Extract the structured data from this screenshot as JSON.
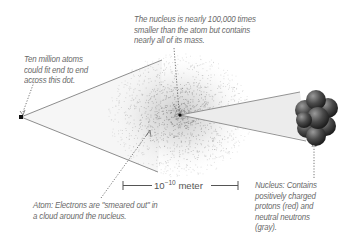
{
  "diagram": {
    "type": "atom-scale-illustration",
    "annotations": {
      "dot": {
        "lines": [
          "Ten million atoms",
          "could fit end to end",
          "across this dot."
        ]
      },
      "nucleus_size": {
        "lines": [
          "The nucleus is nearly 100,000 times",
          "smaller than the atom but contains",
          "nearly all of its mass."
        ]
      },
      "atom": {
        "lines": [
          "Atom: Electrons are \"smeared out\" in",
          "a cloud around the nucleus."
        ]
      },
      "nucleus": {
        "lines": [
          "Nucleus: Contains",
          "positively charged",
          "protons (red) and",
          "neutral neutrons",
          "(gray)."
        ]
      }
    },
    "scale_bar": {
      "base": "10",
      "exponent": "−10",
      "unit": "meter"
    },
    "colors": {
      "text": "#6a6a6a",
      "line": "#777777",
      "cone_fill": "#f2f2f2",
      "cloud": "#8a8a8a",
      "nucleon": "#555555"
    }
  }
}
